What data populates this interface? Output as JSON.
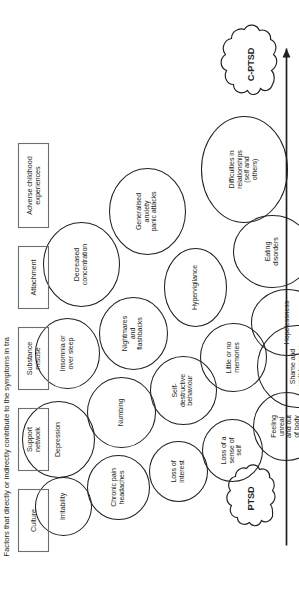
{
  "figure": {
    "title_caption": "Factors that directly or indirectly contribute to the symptoms in tra",
    "orientation": "rotated-90-ccw",
    "stroke_color": "#231f20",
    "box_stroke_color": "#6d6e71",
    "background": "#ffffff"
  },
  "axis": {
    "name": "severity-continuum-arrow",
    "from_label": "PTSD",
    "to_label": "C-PTSD"
  },
  "clouds": [
    {
      "id": "ptsd",
      "label": "PTSD"
    },
    {
      "id": "cptsd",
      "label": "C-PTSD"
    }
  ],
  "symptoms": [
    {
      "id": "irritability",
      "label": "Irritability"
    },
    {
      "id": "chronic-pain",
      "label": "Chronic pain\nheadaches"
    },
    {
      "id": "loss-of-interest",
      "label": "Loss of\ninterest"
    },
    {
      "id": "loss-of-sense-self",
      "label": "Loss of a\nsense of\nself"
    },
    {
      "id": "feeling-unreal",
      "label": "Feeling\nunreal\nand out\nof body"
    },
    {
      "id": "shame",
      "label": "Shame and\nworthlessness"
    },
    {
      "id": "depression",
      "label": "Depression"
    },
    {
      "id": "numbing",
      "label": "Numbing"
    },
    {
      "id": "self-destructive",
      "label": "Self-\ndestructive\nbehaviour"
    },
    {
      "id": "little-no-memories",
      "label": "Little or no\nmemories"
    },
    {
      "id": "hopelessness",
      "label": "Hopelessness"
    },
    {
      "id": "insomnia",
      "label": "Insomnia or\nover sleep"
    },
    {
      "id": "nightmares",
      "label": "Nightmares\nand\nflashbacks"
    },
    {
      "id": "hypervigilance",
      "label": "Hypervigilance"
    },
    {
      "id": "eating-disorders",
      "label": "Eating\ndisorders"
    },
    {
      "id": "decreased-conc",
      "label": "Decreased\nconcentration"
    },
    {
      "id": "generalised-anxiety",
      "label": "Generalised\nanxiety\npanic attacks"
    },
    {
      "id": "difficulties-rel",
      "label": "Difficulties in\nrelationships\n(self and\nothers)"
    }
  ],
  "factor_boxes": [
    {
      "id": "culture",
      "label": "Culture"
    },
    {
      "id": "support-network",
      "label": "Support\nnetwork"
    },
    {
      "id": "substance-misuse",
      "label": "Substance\nmisuse"
    },
    {
      "id": "attachment",
      "label": "Attachment"
    },
    {
      "id": "adverse-childhood",
      "label": "Adverse childhood\nexperiences"
    }
  ]
}
